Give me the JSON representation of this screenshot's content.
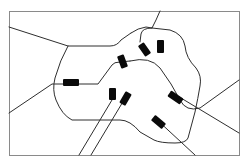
{
  "diagram": {
    "type": "schematic-map",
    "colors": {
      "background": "#ffffff",
      "frame": "#8a8a8a",
      "route": "#2e2e2e",
      "marker": "#0a0a0a"
    },
    "frame": {
      "x": 9,
      "y": 11,
      "width": 230,
      "height": 144
    },
    "routes": [
      {
        "id": "route-ring-west",
        "points": "M9,27 L68,46 L110,46 Q117,46 121,40 L131,33"
      },
      {
        "id": "route-west-south",
        "points": "M68,46 Q60,60 55,78 Q52,90 56,100 Q62,115 72,120 L120,120 Q130,120 140,132 L154,140 Q160,143 175,143 Q186,143 188,138 L195,112 Q198,98 200,86 Q202,76 196,68 Q186,58 185,46 Q183,34 170,30 L152,28"
      },
      {
        "id": "route-ring-north",
        "points": "M131,33 Q138,28 146,27 L152,28 L156,20 L160,11"
      },
      {
        "id": "route-west-cross",
        "points": "M9,113 L52,84 L83,84 L98,84 L112,65 Q114,62 120,62 L130,61"
      },
      {
        "id": "route-north-inner",
        "points": "M152,28 Q142,28 141,34 L140,42"
      },
      {
        "id": "route-east-link",
        "points": "M130,61 Q150,56 160,68 Q172,84 180,100 Q186,112 200,108 L239,80"
      },
      {
        "id": "route-southeast-diag",
        "points": "M171,92 L239,133"
      },
      {
        "id": "route-south-1",
        "points": "M112,100 L79,155"
      },
      {
        "id": "route-south-2",
        "points": "M124,100 L91,155"
      },
      {
        "id": "route-southeast-2",
        "points": "M155,118 L195,155"
      }
    ],
    "markers": [
      {
        "id": "marker-west",
        "x": 63,
        "y": 79,
        "width": 16,
        "height": 7,
        "rotate": 0
      },
      {
        "id": "marker-center-north",
        "x": 119,
        "y": 55,
        "width": 7,
        "height": 13,
        "rotate": -20
      },
      {
        "id": "marker-north-left",
        "x": 141,
        "y": 43,
        "width": 7,
        "height": 13,
        "rotate": -35
      },
      {
        "id": "marker-north-right",
        "x": 157,
        "y": 40,
        "width": 7,
        "height": 13,
        "rotate": 0
      },
      {
        "id": "marker-center-south-1",
        "x": 109,
        "y": 88,
        "width": 7,
        "height": 12,
        "rotate": 0
      },
      {
        "id": "marker-center-south-2",
        "x": 122,
        "y": 92,
        "width": 7,
        "height": 13,
        "rotate": 30
      },
      {
        "id": "marker-east",
        "x": 168,
        "y": 94,
        "width": 15,
        "height": 7,
        "rotate": 35
      },
      {
        "id": "marker-southeast",
        "x": 155,
        "y": 115,
        "width": 7,
        "height": 14,
        "rotate": -50
      }
    ]
  }
}
